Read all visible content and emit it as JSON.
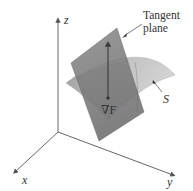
{
  "figure": {
    "axes": {
      "x_label": "x",
      "y_label": "y",
      "z_label": "z"
    },
    "annotations": {
      "tangent_plane_line1": "Tangent",
      "tangent_plane_line2": "plane",
      "surface_label": "S",
      "gradient_label": "∇F"
    },
    "colors": {
      "background": "#ffffff",
      "axis": "#555555",
      "plane_fill": "#7a7a7a",
      "surface_fill": "#b5b5b5",
      "surface_light": "#d0d0d0",
      "vector": "#3a3a3a",
      "text": "#333333"
    }
  }
}
